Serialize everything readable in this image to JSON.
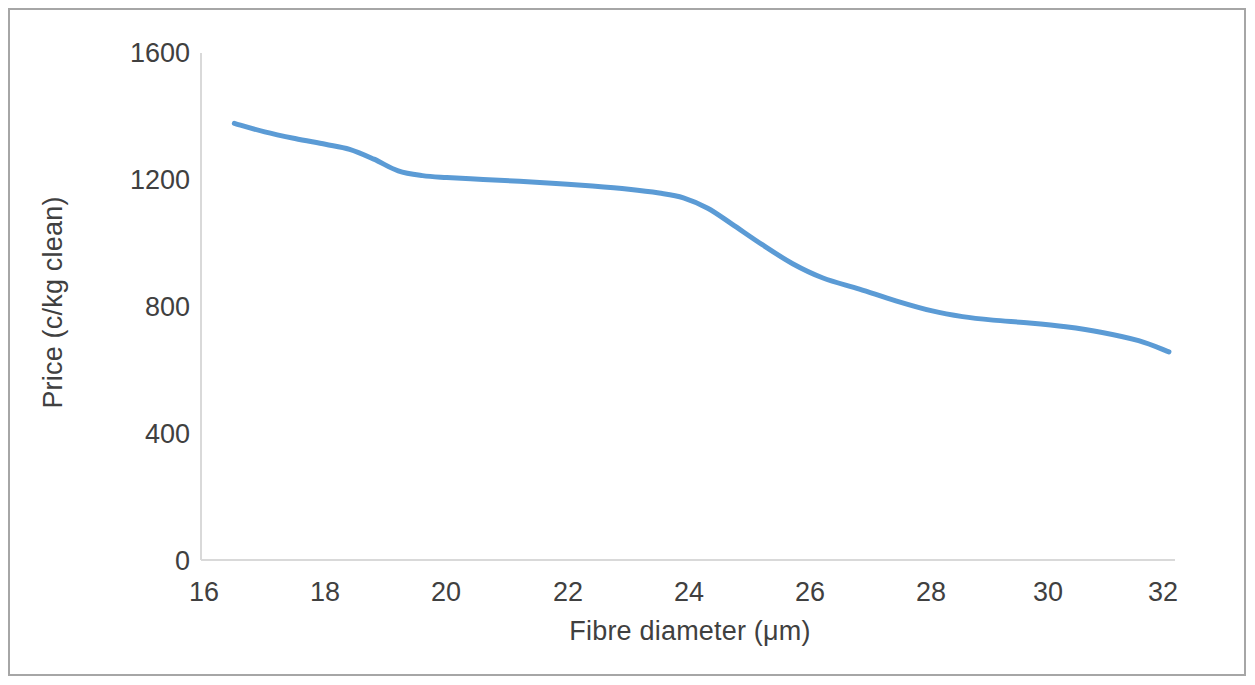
{
  "chart_data": {
    "type": "line",
    "title": "",
    "subtitle": "",
    "xlabel": "Fibre diameter (μm)",
    "ylabel": "Price (c/kg clean)",
    "xlim": [
      16,
      32
    ],
    "ylim": [
      0,
      1600
    ],
    "xticks": [
      "16",
      "18",
      "20",
      "22",
      "24",
      "26",
      "28",
      "30",
      "32"
    ],
    "yticks": [
      "0",
      "400",
      "800",
      "1200",
      "1600"
    ],
    "grid": false,
    "legend": "none",
    "series": [
      {
        "name": "Price vs fibre diameter",
        "color": "#5B9BD5",
        "x": [
          16.5,
          17.0,
          17.5,
          18.0,
          18.4,
          18.8,
          19.2,
          19.6,
          20.0,
          20.6,
          21.2,
          21.8,
          22.4,
          23.0,
          23.5,
          23.9,
          24.3,
          24.7,
          25.2,
          25.7,
          26.2,
          26.8,
          27.4,
          28.0,
          28.5,
          29.0,
          29.6,
          30.2,
          30.8,
          31.4,
          31.9
        ],
        "y": [
          1378,
          1351,
          1330,
          1312,
          1296,
          1265,
          1228,
          1213,
          1207,
          1201,
          1195,
          1188,
          1180,
          1170,
          1158,
          1143,
          1110,
          1060,
          995,
          935,
          890,
          855,
          818,
          786,
          768,
          757,
          748,
          736,
          718,
          692,
          657
        ]
      }
    ]
  },
  "plot_geometry": {
    "axis_color": "#d9d9d9",
    "tick_color": "#404040",
    "plot_left": 204,
    "plot_right": 1175,
    "plot_top": 53,
    "plot_bottom": 560
  }
}
